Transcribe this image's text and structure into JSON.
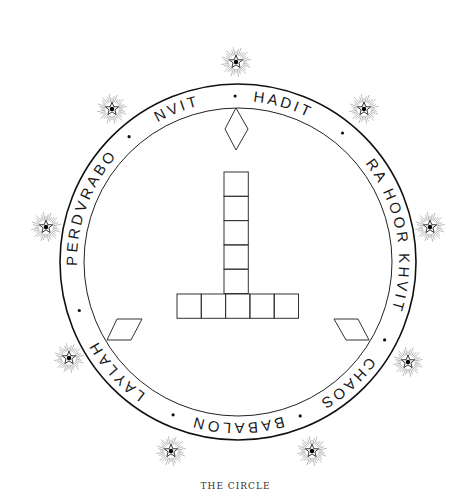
{
  "figure": {
    "caption": "THE CIRCLE",
    "circle": {
      "cx": 238,
      "cy": 262,
      "outer_r": 178,
      "inner_r": 154,
      "text_r": 161
    },
    "ring_labels": [
      {
        "text": "NVIT",
        "angle": -22
      },
      {
        "text": "HADIT",
        "angle": 16
      },
      {
        "text": "RA HOOR KHVIT",
        "angle": 80
      },
      {
        "text": "CHAOS",
        "angle": 138
      },
      {
        "text": "BABALON",
        "angle": 180
      },
      {
        "text": "LAYLAH",
        "angle": 228
      },
      {
        "text": "PERDVRABO",
        "angle": 290
      }
    ],
    "separator_dots_angles": [
      -1,
      39,
      118,
      158,
      203,
      253,
      319
    ],
    "stars": [
      {
        "name": "star-top",
        "x": 236,
        "y": 62
      },
      {
        "name": "star-upper-right",
        "x": 364,
        "y": 109
      },
      {
        "name": "star-right",
        "x": 430,
        "y": 227
      },
      {
        "name": "star-lower-right",
        "x": 408,
        "y": 362
      },
      {
        "name": "star-bottom-right",
        "x": 312,
        "y": 451
      },
      {
        "name": "star-bottom-left",
        "x": 171,
        "y": 451
      },
      {
        "name": "star-lower-left",
        "x": 69,
        "y": 358
      },
      {
        "name": "star-left",
        "x": 46,
        "y": 227
      },
      {
        "name": "star-upper-left",
        "x": 112,
        "y": 109
      }
    ],
    "diamond": {
      "top": [
        236,
        108
      ],
      "right": [
        248,
        129
      ],
      "bottom": [
        236,
        150
      ],
      "left": [
        225,
        129
      ]
    },
    "cross": {
      "vertical_cells": 5,
      "horizontal_cells": 5,
      "cell": 24.3,
      "column_x": 224,
      "column_top": 172,
      "row_y": 294,
      "row_left": 177
    },
    "left_parallelogram": [
      [
        117,
        319
      ],
      [
        142,
        319
      ],
      [
        131,
        340
      ],
      [
        107,
        340
      ]
    ],
    "right_parallelogram": [
      [
        334,
        319
      ],
      [
        358,
        319
      ],
      [
        369,
        340
      ],
      [
        346,
        340
      ]
    ]
  }
}
